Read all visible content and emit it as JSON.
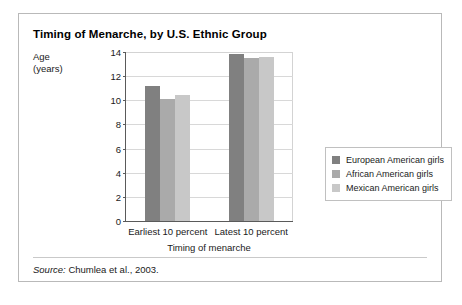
{
  "figure": {
    "title": "Timing of Menarche, by U.S. Ethnic Group",
    "source_word": "Source:",
    "source_text": " Chumlea et al., 2003."
  },
  "chart_data": {
    "type": "bar",
    "title": "Timing of Menarche, by U.S. Ethnic Group",
    "xlabel": "Timing of menarche",
    "ylabel": "Age (years)",
    "ylabel_line1": "Age",
    "ylabel_line2": "(years)",
    "categories": [
      "Earliest 10 percent",
      "Latest 10 percent"
    ],
    "series": [
      {
        "name": "European American girls",
        "values": [
          11.2,
          13.8
        ],
        "color": "#808080"
      },
      {
        "name": "African American girls",
        "values": [
          10.1,
          13.5
        ],
        "color": "#aaaaaa"
      },
      {
        "name": "Mexican American girls",
        "values": [
          10.4,
          13.6
        ],
        "color": "#c8c8c8"
      }
    ],
    "ylim": [
      0,
      14
    ],
    "yticks": [
      0,
      2,
      4,
      6,
      8,
      10,
      12,
      14
    ],
    "grid": true,
    "legend_position": "right"
  }
}
